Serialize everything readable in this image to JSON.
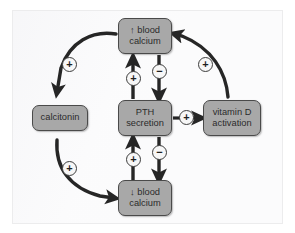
{
  "diagram": {
    "colors": {
      "node_fill": "#a8a8a8",
      "node_border": "#4a4a4a",
      "arrow": "#262626",
      "sign_fill": "#f7f7f7",
      "sign_border": "#3d3d3d",
      "page_background": "#ffffff"
    },
    "nodes": [
      {
        "id": "high-calcium",
        "label": "↑ blood\ncalcium",
        "shape": "rounded-rect"
      },
      {
        "id": "pth",
        "label": "PTH\nsecretion",
        "shape": "rounded-rect"
      },
      {
        "id": "low-calcium",
        "label": "↓ blood\ncalcium",
        "shape": "rounded-rect"
      },
      {
        "id": "calcitonin",
        "label": "calcitonin",
        "shape": "rounded-rect"
      },
      {
        "id": "vitamin-d",
        "label": "vitamin D\nactivation",
        "shape": "rounded-rect"
      }
    ],
    "edges": [
      {
        "id": "high-calcium-to-calcitonin",
        "from": "high-calcium",
        "to": "calcitonin",
        "sign": "+",
        "style": "curved-arc-left"
      },
      {
        "id": "calcitonin-to-low-calcium",
        "from": "calcitonin",
        "to": "low-calcium",
        "sign": "+",
        "style": "curved-arc-left"
      },
      {
        "id": "vitamin-d-to-high-calcium",
        "from": "vitamin-d",
        "to": "high-calcium",
        "sign": "+",
        "style": "curved-arc-right"
      },
      {
        "id": "pth-to-vitamin-d",
        "from": "pth",
        "to": "vitamin-d",
        "sign": "+",
        "style": "straight-right"
      },
      {
        "id": "pth-to-high-calcium",
        "from": "pth",
        "to": "high-calcium",
        "sign": "+",
        "style": "straight-up"
      },
      {
        "id": "high-calcium-to-pth",
        "from": "high-calcium",
        "to": "pth",
        "sign": "−",
        "style": "straight-down"
      },
      {
        "id": "low-calcium-to-pth",
        "from": "low-calcium",
        "to": "pth",
        "sign": "+",
        "style": "straight-up"
      },
      {
        "id": "pth-to-low-calcium",
        "from": "pth",
        "to": "low-calcium",
        "sign": "−",
        "style": "straight-down"
      }
    ],
    "signs": {
      "calcitonin_in": "+",
      "calcitonin_out": "+",
      "vitamin_d_up": "+",
      "pth_to_vitamin_d": "+",
      "pth_up_to_high_calcium": "+",
      "high_calcium_down_to_pth": "−",
      "low_calcium_up_to_pth": "+",
      "pth_down_to_low_calcium": "−"
    }
  }
}
